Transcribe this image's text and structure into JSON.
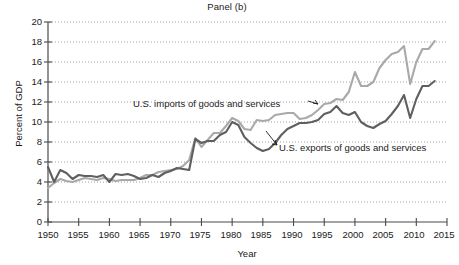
{
  "chart_data": {
    "type": "line",
    "title": "Panel (b)",
    "xlabel": "Year",
    "ylabel": "Percent of GDP",
    "xlim": [
      1950,
      2015
    ],
    "ylim": [
      0,
      20
    ],
    "xticks": [
      1950,
      1955,
      1960,
      1965,
      1970,
      1975,
      1980,
      1985,
      1990,
      1995,
      2000,
      2005,
      2010,
      2015
    ],
    "yticks": [
      0,
      2,
      4,
      6,
      8,
      10,
      12,
      14,
      16,
      18,
      20
    ],
    "grid": "horizontal-dotted",
    "legend": "inline-annotations",
    "annotations": [
      {
        "text": "U.S. imports of goods and services",
        "series": "imports",
        "x": 1974,
        "y": 12.4
      },
      {
        "text": "U.S. exports of goods and services",
        "series": "exports",
        "x": 1992,
        "y": 7.8
      }
    ],
    "x": [
      1950,
      1951,
      1952,
      1953,
      1954,
      1955,
      1956,
      1957,
      1958,
      1959,
      1960,
      1961,
      1962,
      1963,
      1964,
      1965,
      1966,
      1967,
      1968,
      1969,
      1970,
      1971,
      1972,
      1973,
      1974,
      1975,
      1976,
      1977,
      1978,
      1979,
      1980,
      1981,
      1982,
      1983,
      1984,
      1985,
      1986,
      1987,
      1988,
      1989,
      1990,
      1991,
      1992,
      1993,
      1994,
      1995,
      1996,
      1997,
      1998,
      1999,
      2000,
      2001,
      2002,
      2003,
      2004,
      2005,
      2006,
      2007,
      2008,
      2009,
      2010,
      2011,
      2012,
      2013
    ],
    "series": [
      {
        "name": "U.S. imports of goods and services",
        "color": "#a9a9a9",
        "values": [
          3.4,
          3.9,
          4.3,
          4.1,
          4.0,
          4.2,
          4.4,
          4.3,
          4.2,
          4.4,
          4.3,
          4.1,
          4.2,
          4.2,
          4.2,
          4.4,
          4.7,
          4.7,
          5.0,
          5.1,
          5.2,
          5.3,
          5.6,
          6.2,
          8.4,
          7.5,
          8.2,
          8.9,
          8.9,
          9.6,
          10.4,
          10.1,
          9.3,
          9.2,
          10.2,
          10.1,
          10.2,
          10.7,
          10.8,
          10.9,
          10.9,
          10.3,
          10.4,
          10.7,
          11.2,
          11.8,
          11.9,
          12.3,
          12.2,
          13.0,
          15.0,
          13.6,
          13.6,
          14.0,
          15.4,
          16.2,
          16.8,
          17.0,
          17.6,
          13.8,
          16.0,
          17.3,
          17.3,
          18.1
        ]
      },
      {
        "name": "U.S. exports of goods and services",
        "color": "#5f5f5f",
        "values": [
          5.5,
          4.0,
          5.2,
          4.9,
          4.3,
          4.7,
          4.6,
          4.6,
          4.5,
          4.7,
          4.0,
          4.8,
          4.7,
          4.8,
          4.6,
          4.3,
          4.4,
          4.7,
          4.5,
          4.9,
          5.1,
          5.4,
          5.3,
          5.2,
          8.3,
          7.9,
          8.1,
          8.1,
          8.7,
          9.0,
          10.0,
          9.7,
          8.5,
          7.9,
          7.4,
          7.1,
          7.3,
          7.9,
          8.7,
          9.3,
          9.6,
          9.9,
          9.9,
          10.0,
          10.2,
          10.8,
          11.0,
          11.6,
          10.9,
          10.7,
          11.0,
          10.0,
          9.6,
          9.4,
          9.8,
          10.1,
          10.8,
          11.6,
          12.7,
          10.4,
          12.3,
          13.6,
          13.6,
          14.1
        ]
      }
    ]
  },
  "axis": {
    "y_tick_labels": [
      "20",
      "18",
      "16",
      "14",
      "12",
      "10",
      "8",
      "6",
      "4",
      "2",
      "0"
    ],
    "x_tick_labels": [
      "1950",
      "1955",
      "1960",
      "1965",
      "1970",
      "1975",
      "1980",
      "1985",
      "1990",
      "1995",
      "2000",
      "2005",
      "2010",
      "2015"
    ]
  }
}
